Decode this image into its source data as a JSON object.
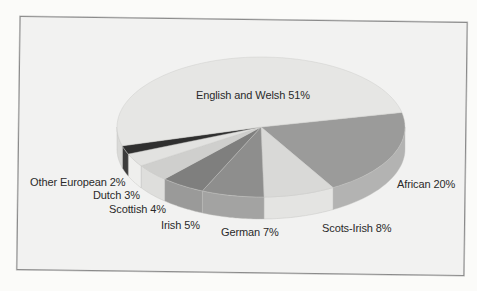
{
  "chart_data": {
    "type": "pie",
    "style": "3d-exploded",
    "title": "",
    "categories": [
      "English and Welsh",
      "African",
      "Scots-Irish",
      "German",
      "Irish",
      "Scottish",
      "Dutch",
      "Other European"
    ],
    "values": [
      51,
      20,
      8,
      7,
      5,
      4,
      3,
      2
    ],
    "unit": "%",
    "labels": [
      "English and Welsh 51%",
      "African 20%",
      "Scots-Irish 8%",
      "German 7%",
      "Irish 5%",
      "Scottish 4%",
      "Dutch 3%",
      "Other European 2%"
    ],
    "colors": [
      "#e6e6e4",
      "#9b9b9a",
      "#d9d9d7",
      "#8e8e8d",
      "#7f7f7e",
      "#cfcfcd",
      "#e2e2e0",
      "#2f2f2f"
    ],
    "side_colors": [
      "#dadad8",
      "#b3b3b2",
      "#e4e4e2",
      "#a3a3a2",
      "#9a9a99",
      "#dededc",
      "#efefed",
      "#3c3c3c"
    ],
    "legend": "none (labels placed next to slices)"
  },
  "labels_pos": [
    {
      "x": 196,
      "y": 89
    },
    {
      "x": 397,
      "y": 178
    },
    {
      "x": 322,
      "y": 222
    },
    {
      "x": 221,
      "y": 226
    },
    {
      "x": 161,
      "y": 219
    },
    {
      "x": 109,
      "y": 203
    },
    {
      "x": 93,
      "y": 189
    },
    {
      "x": 30,
      "y": 176
    }
  ]
}
